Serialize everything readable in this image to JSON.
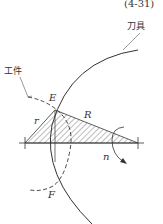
{
  "diagram": {
    "equation_number": "(4-31)",
    "labels": {
      "tool": "刀具",
      "workpiece": "工件",
      "point_e": "E",
      "point_f": "F",
      "small_radius": "r",
      "large_radius": "R",
      "rotation": "n"
    },
    "colors": {
      "line": "#333333",
      "background": "#ffffff"
    }
  }
}
